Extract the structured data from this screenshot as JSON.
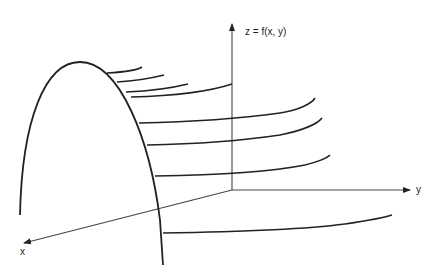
{
  "diagram": {
    "labels": {
      "z_axis": "z = f(x, y)",
      "y_axis": "y",
      "x_axis": "x"
    },
    "colors": {
      "background": "#ffffff",
      "stroke": "#222222",
      "axis": "#444444"
    },
    "axes": {
      "origin": [
        232,
        190
      ],
      "z_end": [
        232,
        22
      ],
      "y_end": [
        412,
        190
      ],
      "x_end": [
        22,
        243
      ]
    },
    "boundary_curve": "M20,215 C22,120 45,62 80,62 C120,62 150,140 160,220 L163,265",
    "cross_section_curves": [
      "M107,73 C125,72 138,70 142,67",
      "M117,82 C135,81 152,78 164,75",
      "M126,92 C150,91 172,88 188,84",
      "M131,97 C170,96 205,93 232,84",
      "M139,123 C190,122 230,120 280,113 C300,110 312,103 315,98",
      "M147,145 C200,144 240,141 280,135 C305,130 318,123 322,118",
      "M155,176 C220,175 270,172 305,165 C320,161 328,157 330,155",
      "M163,233 C230,232 300,230 345,224 C365,221 384,218 392,215"
    ]
  }
}
